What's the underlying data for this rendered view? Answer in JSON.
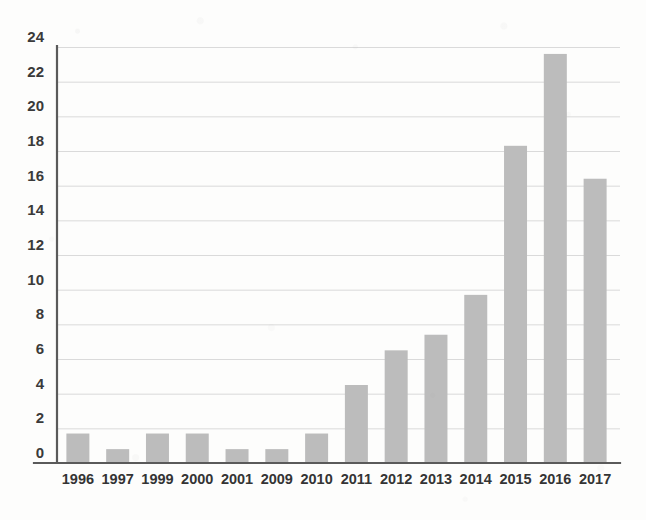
{
  "chart_data": {
    "type": "bar",
    "title": "",
    "subtitle": "",
    "xlabel": "",
    "ylabel": "",
    "categories": [
      "1996",
      "1997",
      "1999",
      "2000",
      "2001",
      "2009",
      "2010",
      "2011",
      "2012",
      "2013",
      "2014",
      "2015",
      "2016",
      "2017"
    ],
    "values": [
      1.7,
      0.8,
      1.7,
      1.7,
      0.8,
      0.8,
      1.7,
      4.5,
      6.5,
      7.4,
      9.7,
      18.3,
      23.6,
      16.4
    ],
    "ylim": [
      0,
      24
    ],
    "y_ticks": [
      0,
      2,
      4,
      6,
      8,
      10,
      12,
      14,
      16,
      18,
      20,
      22,
      24
    ],
    "y_tick_labels": [
      "0",
      "2",
      "4",
      "6",
      "8",
      "10",
      "12",
      "14",
      "16",
      "18",
      "20",
      "22",
      "24"
    ],
    "grid": true,
    "grid_axis": "y",
    "legend": false,
    "legend_position": "none",
    "bar_color": "#bcbcbc",
    "gridline_color": "#dadada",
    "axis_color": "#5a5a5a",
    "background_color": "#fdfdfc",
    "tick_label_color": "#343434"
  }
}
